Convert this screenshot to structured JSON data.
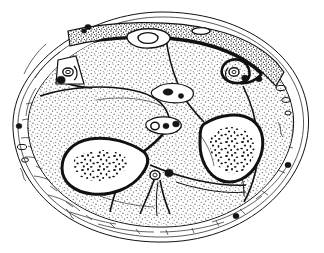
{
  "figure": {
    "title": "Transverse cross-section of the lower leg",
    "domain_note": "anatomical line illustration, black ink on white",
    "width_px": 324,
    "height_px": 253,
    "background_color": "#ffffff",
    "ink_color": "#111111",
    "stipple_color": "#2b2b2b"
  },
  "layers": {
    "skin_outline": {
      "label": "skin-outline",
      "stroke": "#111111"
    },
    "subcutaneous_fat": {
      "label": "subcutaneous-fat-layer",
      "fill": "#ffffff"
    },
    "deep_fascia": {
      "label": "deep-fascia",
      "stroke": "#111111"
    },
    "subcutaneous_band": {
      "label": "subcutaneous-tibial-band",
      "fill": "stipple-dense"
    }
  },
  "bones": [
    {
      "name": "tibia",
      "position": "lower-left",
      "marrow": "speckled-trabecular",
      "cortex": "thick-dark-outline"
    },
    {
      "name": "fibula",
      "position": "right",
      "marrow": "speckled-trabecular",
      "cortex": "thick-dark-outline"
    }
  ],
  "compartments": [
    {
      "name": "anterior-compartment",
      "position": "upper-left"
    },
    {
      "name": "lateral-compartment",
      "position": "upper-right"
    },
    {
      "name": "deep-posterior-compartment",
      "position": "center"
    },
    {
      "name": "superficial-posterior-compartment",
      "position": "lower-center"
    },
    {
      "name": "posterior-lateral-compartment",
      "position": "lower-right"
    }
  ],
  "neurovascular_bundles": [
    {
      "name": "anterior-tibial-bundle",
      "x": 62,
      "y": 77,
      "artery": true,
      "vein": true
    },
    {
      "name": "central-bundle-upper",
      "x": 170,
      "y": 93,
      "artery": false,
      "vein": true
    },
    {
      "name": "central-bundle-mid",
      "x": 162,
      "y": 126,
      "artery": true,
      "vein": true
    },
    {
      "name": "posterior-tibial-bundle",
      "x": 157,
      "y": 175,
      "artery": true,
      "vein": true
    },
    {
      "name": "peroneal-bundle",
      "x": 236,
      "y": 76,
      "artery": true,
      "vein": true
    }
  ],
  "superficial_veins": [
    {
      "name": "great-saphenous-vein",
      "x": 148,
      "y": 38
    },
    {
      "name": "small-saphenous-vein",
      "x": 200,
      "y": 32
    },
    {
      "name": "perforating-vein-left",
      "x": 18,
      "y": 126
    },
    {
      "name": "perforating-vein-right",
      "x": 287,
      "y": 165
    },
    {
      "name": "perforating-vein-bottom",
      "x": 235,
      "y": 216
    },
    {
      "name": "perforating-vein-topleft",
      "x": 88,
      "y": 26
    },
    {
      "name": "perforating-vein-upperright",
      "x": 258,
      "y": 80
    }
  ],
  "markers": {
    "vein_glyph": "filled-oval",
    "artery_glyph": "ring-oval",
    "nerve_glyph": "small-ring"
  }
}
